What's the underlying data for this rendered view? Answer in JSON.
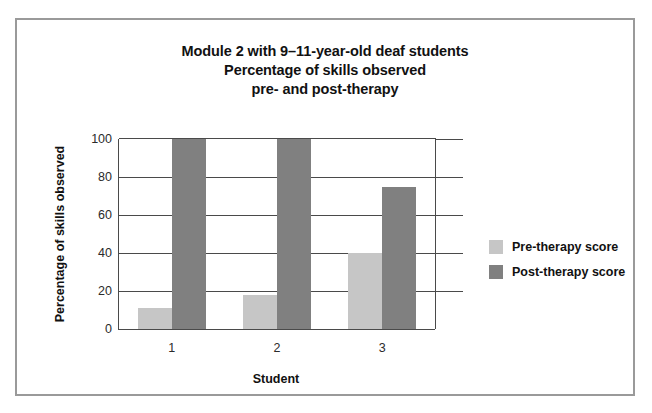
{
  "chart_data": {
    "type": "bar",
    "title": "Module 2 with 9–11-year-old deaf students\nPercentage of skills observed\npre- and post-therapy",
    "title_lines": [
      "Module 2 with 9–11-year-old deaf students",
      "Percentage of skills observed",
      "pre- and post-therapy"
    ],
    "xlabel": "Student",
    "ylabel": "Percentage of skills observed",
    "categories": [
      "1",
      "2",
      "3"
    ],
    "series": [
      {
        "name": "Pre-therapy score",
        "color": "#c6c6c6",
        "values": [
          11,
          18,
          40
        ]
      },
      {
        "name": "Post-therapy score",
        "color": "#808080",
        "values": [
          100,
          100,
          75
        ]
      }
    ],
    "ylim": [
      0,
      100
    ],
    "yticks": [
      0,
      20,
      40,
      60,
      80,
      100
    ],
    "ytick_labels": [
      "0",
      "20",
      "40",
      "60",
      "80",
      "100"
    ],
    "grid": true,
    "legend_position": "right",
    "frame_color": "#9a9a9a",
    "axis_color": "#4a4a4a",
    "background": "#ffffff"
  }
}
